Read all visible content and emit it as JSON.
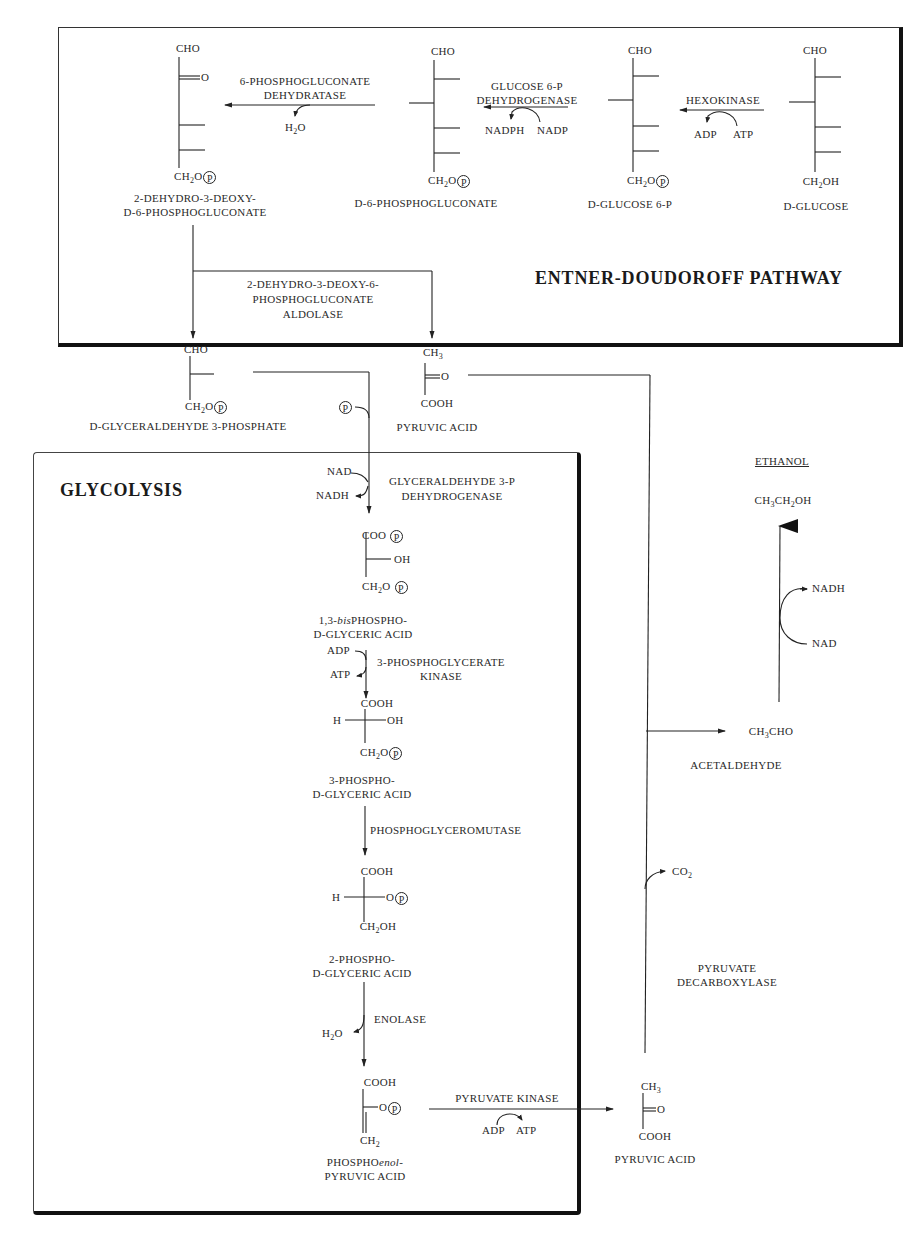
{
  "panels": {
    "entner_doudoroff": {
      "title": "ENTNER-DOUDOROFF PATHWAY"
    },
    "glycolysis": {
      "title": "GLYCOLYSIS"
    },
    "ethanol": {
      "title": "ETHANOL"
    }
  },
  "compounds": {
    "d_glucose": {
      "top": "CHO",
      "bottom": "CH₂OH",
      "name": "D-GLUCOSE"
    },
    "d_glucose_6p": {
      "top": "CHO",
      "bottom": "CH₂O",
      "phosphate": "P",
      "name": "D-GLUCOSE 6-P"
    },
    "d_6_phosphogluconate": {
      "top": "CHO",
      "bottom": "CH₂O",
      "phosphate": "P",
      "name": "D-6-PHOSPHOGLUCONATE"
    },
    "kdpg": {
      "top": "CHO",
      "keto": "O",
      "bottom": "CH₂O",
      "phosphate": "P",
      "name_line1": "2-DEHYDRO-3-DEOXY-",
      "name_line2": "D-6-PHOSPHOGLUCONATE"
    },
    "g3p": {
      "top": "CHO",
      "bottom": "CH₂O",
      "phosphate": "P",
      "name": "D-GLYCERALDEHYDE 3-PHOSPHATE"
    },
    "pyruvic_acid_ed": {
      "top": "CH₃",
      "keto": "O",
      "bottom": "COOH",
      "name": "PYRUVIC ACID"
    },
    "bpg": {
      "top": "COO",
      "side": "OH",
      "bottom": "CH₂O",
      "phosphate": "P",
      "name_line1_prefix": "1,3-",
      "name_line1_italic": "bis",
      "name_line1_suffix": "PHOSPHO-",
      "name_line2": "D-GLYCERIC ACID"
    },
    "pg3": {
      "top": "COOH",
      "left": "H",
      "right": "OH",
      "bottom": "CH₂O",
      "phosphate": "P",
      "name_line1": "3-PHOSPHO-",
      "name_line2": "D-GLYCERIC ACID"
    },
    "pg2": {
      "top": "COOH",
      "left": "H",
      "right": "O",
      "phosphate": "P",
      "bottom": "CH₂OH",
      "name_line1": "2-PHOSPHO-",
      "name_line2": "D-GLYCERIC ACID"
    },
    "pep": {
      "top": "COOH",
      "right": "O",
      "phosphate": "P",
      "bottom": "CH₂",
      "name_line1_prefix": "PHOSPHO",
      "name_line1_italic": "enol",
      "name_line1_suffix": "-",
      "name_line2": "PYRUVIC ACID"
    },
    "pyruvic_acid_gly": {
      "top": "CH₃",
      "keto": "O",
      "bottom": "COOH",
      "name": "PYRUVIC ACID"
    },
    "acetaldehyde": {
      "formula": "CH₃CHO",
      "name": "ACETALDEHYDE"
    },
    "ethanol": {
      "formula": "CH₃CH₂OH"
    }
  },
  "enzymes": {
    "hexokinase": {
      "label": "HEXOKINASE",
      "in": "ATP",
      "out": "ADP"
    },
    "g6p_dehydrogenase": {
      "line1": "GLUCOSE 6-P",
      "line2": "DEHYDROGENASE",
      "in": "NADP",
      "out": "NADPH"
    },
    "pg_dehydratase": {
      "line1": "6-PHOSPHOGLUCONATE",
      "line2": "DEHYDRATASE",
      "out": "H₂O"
    },
    "kdpg_aldolase": {
      "line1": "2-DEHYDRO-3-DEOXY-6-",
      "line2": "PHOSPHOGLUCONATE",
      "line3": "ALDOLASE"
    },
    "gapdh": {
      "line1": "GLYCERALDEHYDE 3-P",
      "line2": "DEHYDROGENASE",
      "in": "NAD",
      "out": "NADH",
      "phosphate": "P"
    },
    "pgk": {
      "line1": "3-PHOSPHOGLYCERATE",
      "line2": "KINASE",
      "in": "ADP",
      "out": "ATP"
    },
    "pgm": {
      "label": "PHOSPHOGLYCEROMUTASE"
    },
    "enolase": {
      "label": "ENOLASE",
      "out": "H₂O"
    },
    "pyruvate_kinase": {
      "label": "PYRUVATE KINASE",
      "in": "ADP",
      "out": "ATP"
    },
    "pyruvate_decarboxylase": {
      "line1": "PYRUVATE",
      "line2": "DECARBOXYLASE",
      "out": "CO₂"
    },
    "alcohol_dehydrogenase": {
      "in": "NADH",
      "out": "NAD"
    }
  },
  "colors": {
    "ink": "#222222",
    "background": "#ffffff"
  }
}
